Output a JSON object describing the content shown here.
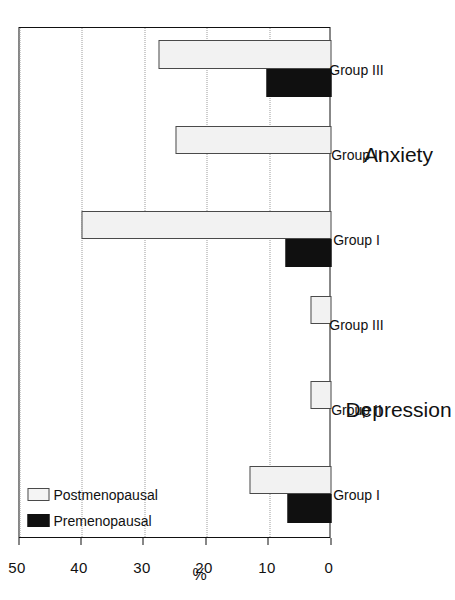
{
  "chart_data": {
    "type": "bar",
    "orientation": "vertical-bars-rotated",
    "title": "",
    "xlabel": "",
    "ylabel": "%",
    "ylim": [
      0,
      50
    ],
    "yticks": [
      0,
      10,
      20,
      30,
      40,
      50
    ],
    "ytick_labels": [
      "0",
      "10",
      "20",
      "30",
      "40",
      "50"
    ],
    "grid": "y-gridlines dotted",
    "legend_position": "top-left inside axes",
    "group_titles": [
      "Depression",
      "Anxiety"
    ],
    "categories": [
      "Group I",
      "Group II",
      "Group III",
      "Group I",
      "Group II",
      "Group III"
    ],
    "series": [
      {
        "name": "Premenopausal",
        "color": "#101010",
        "fill": "solid-black",
        "values": [
          7.0,
          0,
          0,
          7.4,
          0,
          10.4
        ]
      },
      {
        "name": "Postmenopausal",
        "color": "#f2f2f2",
        "fill": "dotted-stipple",
        "values": [
          13.1,
          3.4,
          3.4,
          40.0,
          25.0,
          27.7
        ]
      }
    ],
    "annotations": []
  },
  "axis": {
    "y_title": "%",
    "ticks": [
      "0",
      "10",
      "20",
      "30",
      "40",
      "50"
    ]
  },
  "legend": {
    "items": [
      {
        "label": "Premenopausal",
        "swatch": "solid-black"
      },
      {
        "label": "Postmenopausal",
        "swatch": "dotted-stipple"
      }
    ]
  },
  "groups": [
    {
      "title": "Depression",
      "categories": [
        "Group I",
        "Group II",
        "Group III"
      ]
    },
    {
      "title": "Anxiety",
      "categories": [
        "Group I",
        "Group II",
        "Group III"
      ]
    }
  ]
}
